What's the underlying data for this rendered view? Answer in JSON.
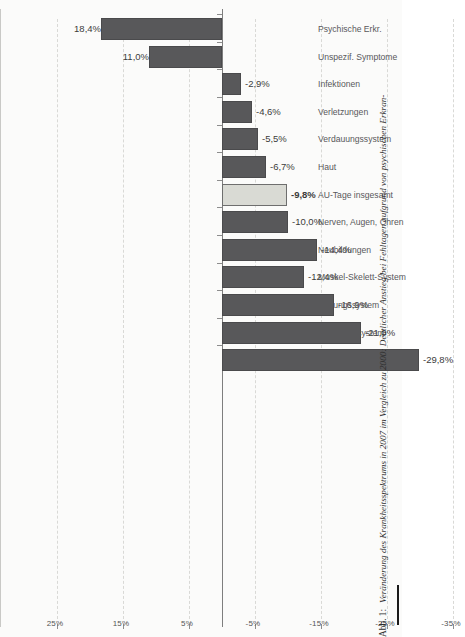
{
  "figure": {
    "label": "Abb. 1:",
    "caption": "Veränderung des Krankheitsspektrums in 2007 im Vergleich zu 2000: Deutlicher Anstieg bei Fehltagen aufgrund von psychischen Erkran-"
  },
  "colors": {
    "bar": "#58585a",
    "bar_highlight": "#d9dad4",
    "axis": "#8d8d8d",
    "grid": "#d9d9d6",
    "text": "#3b3b3b"
  },
  "chart_data": {
    "type": "bar",
    "title": "",
    "subtitle": "",
    "xlabel": "",
    "ylabel": "",
    "orientation": "vertical-rotated",
    "grid": true,
    "legend": "none",
    "ylim": [
      -35,
      25
    ],
    "ytick_labels": [
      "25%",
      "15%",
      "5%",
      "-5%",
      "-15%",
      "-25%",
      "-35%"
    ],
    "yticks": [
      25,
      15,
      5,
      -5,
      -15,
      -25,
      -35
    ],
    "categories": [
      "Psychische Erkr.",
      "Unspezif. Symptome",
      "Infektionen",
      "Verletzungen",
      "Verdauungssystem",
      "Haut",
      "AU-Tage insgesamt",
      "Nerven, Augen, Ohren",
      "Neubildungen",
      "Muskel-Skelett-System",
      "Atmungssystem",
      "Urogenitalsystem",
      "Kreislaufsystem"
    ],
    "values": [
      18.4,
      11.0,
      -2.9,
      -4.6,
      -5.5,
      -6.7,
      -9.8,
      -10.0,
      -14.4,
      -12.4,
      -16.9,
      -21.0,
      -29.8
    ],
    "value_labels": [
      "18,4%",
      "11,0%",
      "-2,9%",
      "-4,6%",
      "-5,5%",
      "-6,7%",
      "-9,8%",
      "-10,0%",
      "-14,4%",
      "-12,4%",
      "-16,9%",
      "-21,0%",
      "-29,8%"
    ],
    "highlighted_index": 6,
    "highlighted_category": "AU-Tage insgesamt"
  }
}
